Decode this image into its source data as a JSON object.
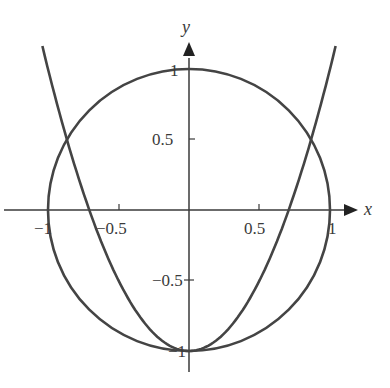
{
  "chart_data": {
    "type": "line",
    "title": "",
    "xlabel": "x",
    "ylabel": "y",
    "xlim": [
      -1.3,
      1.3
    ],
    "ylim": [
      -1.0,
      1.15
    ],
    "grid": false,
    "legend": "none",
    "x_ticks": [
      "-1",
      "-0.5",
      "0.5",
      "1"
    ],
    "y_ticks": [
      "1",
      "0.5",
      "-0.5",
      "-1"
    ],
    "series": [
      {
        "name": "circle x^2 + y^2 = 1",
        "equation": "x^2 + y^2 = 1"
      },
      {
        "name": "parabola y = 2x^2 - 1",
        "equation": "y = 2x^2 - 1",
        "x_range": [
          -1.04,
          1.04
        ]
      }
    ],
    "intersections": [
      [
        -0.866,
        0.5
      ],
      [
        0.866,
        0.5
      ],
      [
        0,
        -1
      ]
    ],
    "color": "#444444"
  },
  "labels": {
    "x_axis": "x",
    "y_axis": "y",
    "xt_m1": "−1",
    "xt_m05": "−0.5",
    "xt_05": "0.5",
    "xt_1": "1",
    "yt_1": "1",
    "yt_05": "0.5",
    "yt_m05": "−0.5",
    "yt_m1": "−1"
  }
}
